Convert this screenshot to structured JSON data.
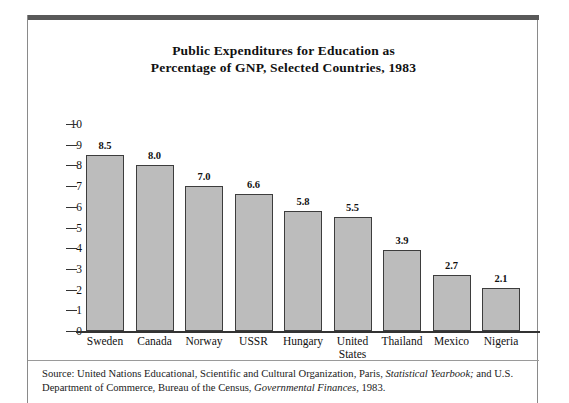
{
  "figure": {
    "title_line1": "Public Expenditures for Education as",
    "title_line2": "Percentage of GNP, Selected Countries, 1983",
    "source_prefix": "Source: United Nations Educational, Scientific and Cultural Organization, Paris, ",
    "source_italic1": "Statistical Yearbook;",
    "source_middle": " and U.S. Department of Commerce, Bureau of the Census, ",
    "source_italic2": "Governmental Finances,",
    "source_suffix": " 1983.",
    "frame_color": "#8a8a8a",
    "rule_color": "#595959"
  },
  "chart_data": {
    "type": "bar",
    "title": "Public Expenditures for Education as Percentage of GNP, Selected Countries, 1983",
    "xlabel": "",
    "ylabel": "",
    "ylim": [
      0,
      10
    ],
    "yticks": [
      "0",
      "1",
      "2",
      "3",
      "4",
      "5",
      "6",
      "7",
      "8",
      "9",
      "10"
    ],
    "grid": false,
    "legend": "none",
    "bar_fill": "#bcbcbc",
    "bar_edge": "#3d3d3d",
    "categories": [
      "Sweden",
      "Canada",
      "Norway",
      "USSR",
      "Hungary",
      "United\nStates",
      "Thailand",
      "Mexico",
      "Nigeria"
    ],
    "values": [
      8.5,
      8.0,
      7.0,
      6.6,
      5.8,
      5.5,
      3.9,
      2.7,
      2.1
    ],
    "value_labels": [
      "8.5",
      "8.0",
      "7.0",
      "6.6",
      "5.8",
      "5.5",
      "3.9",
      "2.7",
      "2.1"
    ]
  }
}
